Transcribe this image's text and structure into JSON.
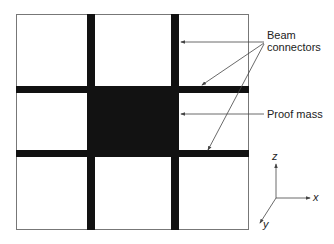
{
  "diagram": {
    "labels": {
      "beam_connectors_line1": "Beam",
      "beam_connectors_line2": "connectors",
      "proof_mass": "Proof mass"
    },
    "axes": {
      "x": "x",
      "y": "y",
      "z": "z"
    },
    "colors": {
      "beam": "#111111",
      "frame": "#777777",
      "arrow": "#444444"
    }
  }
}
